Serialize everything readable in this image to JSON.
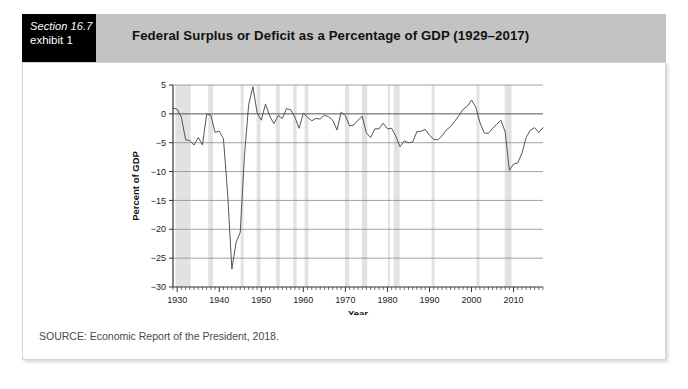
{
  "exhibit": {
    "section_label": "Section 16.7",
    "exhibit_label": "exhibit 1",
    "title": "Federal Surplus or Deficit as a Percentage of GDP (1929–2017)"
  },
  "footer": {
    "source": "SOURCE: Economic Report of the President, 2018."
  },
  "colors": {
    "header_band": "#c3c3c3",
    "exhibit_box": "#000000",
    "card_background": "#ffffff",
    "card_border": "#d4d4d4",
    "line": "#555555",
    "gridline": "#8a8a8a",
    "zero_line": "#555555",
    "recession_band": "#e2e2e2",
    "axis": "#333333"
  },
  "chart_data": {
    "type": "line",
    "title": "Federal Surplus or Deficit as a Percentage of GDP (1929–2017)",
    "xlabel": "Year",
    "ylabel": "Percent of GDP",
    "xlim": [
      1929,
      2017
    ],
    "ylim": [
      -30,
      5
    ],
    "yticks": [
      5,
      0,
      -5,
      -10,
      -15,
      -20,
      -25,
      -30
    ],
    "ytick_labels": [
      "5",
      "0",
      "−5",
      "−10",
      "−15",
      "−20",
      "−25",
      "−30"
    ],
    "xticks": [
      1930,
      1940,
      1950,
      1960,
      1970,
      1980,
      1990,
      2000,
      2010
    ],
    "xtick_labels": [
      "1930",
      "1940",
      "1950",
      "1960",
      "1970",
      "1980",
      "1990",
      "2000",
      "2010"
    ],
    "minor_xtick_step": 1,
    "grid": "horizontal",
    "legend": "none",
    "zero_reference_line": 0,
    "recession_bands": [
      [
        1929.6,
        1933.2
      ],
      [
        1937.4,
        1938.5
      ],
      [
        1945.1,
        1945.8
      ],
      [
        1948.9,
        1949.8
      ],
      [
        1953.5,
        1954.4
      ],
      [
        1957.6,
        1958.4
      ],
      [
        1960.3,
        1961.2
      ],
      [
        1969.9,
        1970.9
      ],
      [
        1973.9,
        1975.2
      ],
      [
        1980.1,
        1980.6
      ],
      [
        1981.5,
        1982.9
      ],
      [
        1990.5,
        1991.2
      ],
      [
        2001.2,
        2001.9
      ],
      [
        2007.9,
        2009.5
      ]
    ],
    "series": [
      {
        "name": "Federal surplus or deficit (% of GDP)",
        "x": [
          1929,
          1930,
          1931,
          1932,
          1933,
          1934,
          1935,
          1936,
          1937,
          1938,
          1939,
          1940,
          1941,
          1942,
          1943,
          1944,
          1945,
          1946,
          1947,
          1948,
          1949,
          1950,
          1951,
          1952,
          1953,
          1954,
          1955,
          1956,
          1957,
          1958,
          1959,
          1960,
          1961,
          1962,
          1963,
          1964,
          1965,
          1966,
          1967,
          1968,
          1969,
          1970,
          1971,
          1972,
          1973,
          1974,
          1975,
          1976,
          1977,
          1978,
          1979,
          1980,
          1981,
          1982,
          1983,
          1984,
          1985,
          1986,
          1987,
          1988,
          1989,
          1990,
          1991,
          1992,
          1993,
          1994,
          1995,
          1996,
          1997,
          1998,
          1999,
          2000,
          2001,
          2002,
          2003,
          2004,
          2005,
          2006,
          2007,
          2008,
          2009,
          2010,
          2011,
          2012,
          2013,
          2014,
          2015,
          2016,
          2017
        ],
        "values": [
          1.0,
          0.8,
          -0.6,
          -4.5,
          -4.6,
          -5.4,
          -4.1,
          -5.4,
          -0.1,
          -0.2,
          -3.2,
          -3.0,
          -4.3,
          -13.9,
          -26.9,
          -22.3,
          -20.5,
          -7.2,
          1.6,
          4.7,
          0.2,
          -1.1,
          1.7,
          -0.4,
          -1.7,
          -0.3,
          -0.8,
          0.9,
          0.7,
          -0.6,
          -2.5,
          0.1,
          -0.6,
          -1.2,
          -0.8,
          -0.9,
          -0.2,
          -0.5,
          -1.1,
          -2.8,
          0.3,
          -0.3,
          -2.1,
          -1.9,
          -1.1,
          -0.4,
          -3.3,
          -4.1,
          -2.6,
          -2.6,
          -1.6,
          -2.6,
          -2.5,
          -3.9,
          -5.7,
          -4.7,
          -5.0,
          -4.9,
          -3.1,
          -3.0,
          -2.7,
          -3.7,
          -4.4,
          -4.5,
          -3.8,
          -2.8,
          -2.2,
          -1.3,
          -0.3,
          0.8,
          1.3,
          2.4,
          1.2,
          -1.5,
          -3.3,
          -3.4,
          -2.5,
          -1.8,
          -1.1,
          -3.1,
          -9.8,
          -8.7,
          -8.5,
          -6.8,
          -4.1,
          -2.8,
          -2.4,
          -3.2,
          -2.4
        ]
      }
    ]
  }
}
